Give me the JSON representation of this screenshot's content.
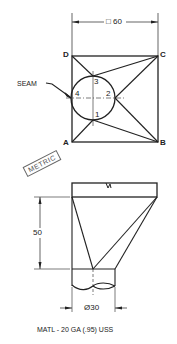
{
  "top_view": {
    "dimension_label": "□ 60",
    "corners": {
      "a": "A",
      "b": "B",
      "c": "C",
      "d": "D"
    },
    "seam_label": "SEAM",
    "circle_points": {
      "p1": "1",
      "p2": "2",
      "p3": "3",
      "p4": "4"
    }
  },
  "stamp": {
    "label": "METRIC"
  },
  "front_view": {
    "height_dimension": "50",
    "diameter_dimension": "Ø30"
  },
  "note": {
    "material": "MATL - 20 GA (.95) USS"
  }
}
